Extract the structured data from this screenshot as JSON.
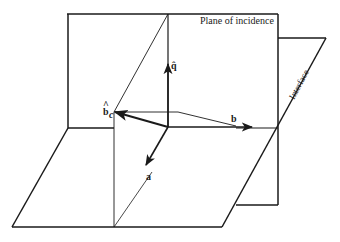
{
  "figure": {
    "type": "geometric diagram",
    "stroke_color": "#1a1a1a",
    "background": "#ffffff"
  },
  "labels": {
    "plane_of_incidence": "Plane of incidence",
    "interface": "Interface",
    "q_hat": "q̂",
    "b_c": "b",
    "b_c_subscript": "c",
    "b_c_hat": "^",
    "b": "b",
    "a": "a"
  },
  "vectors": [
    {
      "name": "q",
      "from": [
        168,
        127
      ],
      "to": [
        168,
        63
      ]
    },
    {
      "name": "b",
      "from": [
        168,
        127
      ],
      "to": [
        253,
        127
      ]
    },
    {
      "name": "b_c",
      "from": [
        168,
        127
      ],
      "to": [
        114,
        112
      ]
    },
    {
      "name": "a",
      "from": [
        168,
        127
      ],
      "to": [
        146,
        166
      ]
    }
  ]
}
